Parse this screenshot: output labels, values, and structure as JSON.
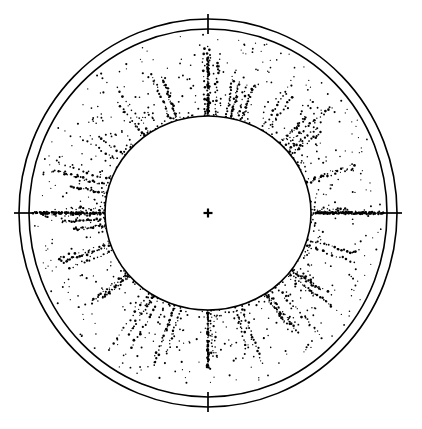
{
  "figure": {
    "title": "",
    "background_color": "#ffffff",
    "ink_color": "#000000",
    "width": 422,
    "height": 429
  },
  "chart_data": {
    "type": "scatter",
    "projection": "polar",
    "title": "",
    "subtitle": "",
    "xlabel": "",
    "ylabel": "",
    "grid": false,
    "legend": null,
    "legend_position": "none",
    "center": {
      "x": 208,
      "y": 213
    },
    "rings": [
      {
        "name": "outer-ring",
        "rx": 189,
        "ry": 194,
        "stroke_width": 1.6
      },
      {
        "name": "middle-ring",
        "rx": 179,
        "ry": 184,
        "stroke_width": 1.6
      },
      {
        "name": "inner-void-boundary",
        "rx": 103,
        "ry": 97,
        "stroke_width": 1.6
      }
    ],
    "tick_marks": [
      {
        "label": "",
        "angle_deg": 90,
        "position": "top",
        "length": 14
      },
      {
        "label": "",
        "angle_deg": 0,
        "position": "right",
        "length": 14
      },
      {
        "label": "",
        "angle_deg": 270,
        "position": "bottom",
        "length": 14
      },
      {
        "label": "",
        "angle_deg": 180,
        "position": "left",
        "length": 14
      }
    ],
    "center_marker": {
      "symbol": "+",
      "size": 9
    },
    "radial_streaks_deg": [
      0,
      18,
      36,
      54,
      72,
      90,
      108,
      126,
      144,
      162,
      180,
      198,
      216,
      234,
      252,
      270,
      288,
      306,
      324,
      342
    ],
    "dense_axis_streaks_deg": [
      0,
      180,
      90,
      270
    ],
    "point_count_approx": 1150,
    "radial_range": [
      0.98,
      1.82
    ],
    "angular_range_deg": [
      0,
      360
    ],
    "point_size_px": [
      1,
      2.4
    ],
    "values": []
  },
  "annotations": {
    "center_cross": "+"
  }
}
